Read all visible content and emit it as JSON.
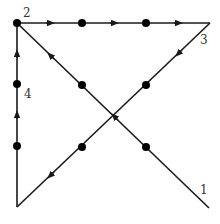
{
  "colors": {
    "line": "#1a1a1a",
    "dot": "#000000",
    "label": "#333333",
    "background": "#ffffff"
  },
  "grid_dots": [
    {
      "x": 17,
      "y": 23
    },
    {
      "x": 82,
      "y": 23
    },
    {
      "x": 146,
      "y": 23
    },
    {
      "x": 17,
      "y": 84
    },
    {
      "x": 82,
      "y": 85
    },
    {
      "x": 146,
      "y": 85
    },
    {
      "x": 17,
      "y": 146
    },
    {
      "x": 82,
      "y": 147
    },
    {
      "x": 146,
      "y": 147
    }
  ],
  "segments": [
    {
      "id": 1,
      "from": {
        "x": 209,
        "y": 208
      },
      "to": {
        "x": 17,
        "y": 23
      }
    },
    {
      "id": 2,
      "from": {
        "x": 17,
        "y": 23
      },
      "to": {
        "x": 210,
        "y": 23
      }
    },
    {
      "id": 3,
      "from": {
        "x": 210,
        "y": 23
      },
      "to": {
        "x": 17,
        "y": 207
      }
    },
    {
      "id": 4,
      "from": {
        "x": 17,
        "y": 207
      },
      "to": {
        "x": 17,
        "y": 23
      }
    }
  ],
  "labels": [
    {
      "text": "1",
      "x": 200,
      "y": 194
    },
    {
      "text": "2",
      "x": 23,
      "y": 17
    },
    {
      "text": "3",
      "x": 200,
      "y": 44
    },
    {
      "text": "4",
      "x": 24,
      "y": 98
    }
  ]
}
